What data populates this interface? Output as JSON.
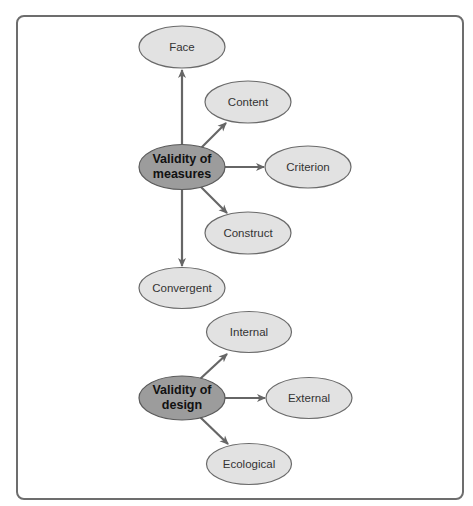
{
  "colors": {
    "frame_border": "#6d6d6d",
    "root_fill": "#9c9c9c",
    "leaf_fill": "#e2e2e2",
    "node_stroke": "#6a6a6a",
    "arrow": "#666666"
  },
  "groups": [
    {
      "root": {
        "line1": "Validity of",
        "line2": "measures"
      },
      "children": [
        "Face",
        "Content",
        "Criterion",
        "Construct",
        "Convergent"
      ]
    },
    {
      "root": {
        "line1": "Validity of",
        "line2": "design"
      },
      "children": [
        "Internal",
        "External",
        "Ecological"
      ]
    }
  ],
  "nodes": {
    "face": "Face",
    "content": "Content",
    "criterion": "Criterion",
    "construct": "Construct",
    "convergent": "Convergent",
    "internal": "Internal",
    "external": "External",
    "ecological": "Ecological",
    "measures_line1": "Validity of",
    "measures_line2": "measures",
    "design_line1": "Validity of",
    "design_line2": "design"
  }
}
